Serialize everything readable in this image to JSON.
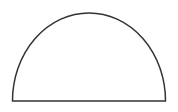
{
  "diagram": {
    "shape": "semicircle",
    "stroke_color": "#333333",
    "fill_color": "#ffffff",
    "background": "#ffffff",
    "geometry": {
      "left_x": 12,
      "right_x": 166,
      "base_y": 101,
      "top_y": 13
    }
  }
}
